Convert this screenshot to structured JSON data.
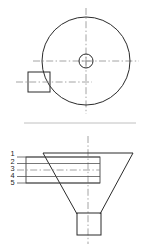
{
  "drawing": {
    "title": "Conical hopper two-view engineering drawing",
    "views": [
      {
        "id": "top-view",
        "name": "Top view",
        "shapes": {
          "circle": {
            "cx": 86,
            "cy": 61,
            "r": 44
          },
          "hub_outer": {
            "cx": 86,
            "cy": 61,
            "r": 7
          },
          "hub_inner_marker": "plus",
          "inlet_box": {
            "x": 28,
            "y": 72,
            "width": 22,
            "height": 20
          }
        },
        "centerlines": {
          "vertical": {
            "x": 86,
            "y1": 8,
            "y2": 114
          },
          "horizontal": {
            "y": 61,
            "x1": 33,
            "x2": 139
          },
          "inlet_horizontal": {
            "y": 82,
            "x1": 16,
            "x2": 92
          }
        }
      },
      {
        "id": "front-section-view",
        "name": "Front section view",
        "shapes": {
          "funnel_top": {
            "x1": 43,
            "x2": 133,
            "y": 153
          },
          "funnel_left_slope": {
            "x1": 43,
            "y1": 153,
            "x2": 77,
            "y2": 214
          },
          "funnel_right_slope": {
            "x1": 133,
            "y1": 153,
            "x2": 100,
            "y2": 214
          },
          "spout_box": {
            "x": 77,
            "y": 213,
            "width": 24,
            "height": 22
          },
          "layer_box": {
            "x": 26,
            "y": 157,
            "width": 74,
            "height": 26
          }
        },
        "centerlines": {
          "vertical": {
            "x": 88,
            "y1": 136,
            "y2": 244
          },
          "layer_horizontal": {
            "y": 170,
            "x1": 22,
            "x2": 100
          }
        },
        "hatch_lines_y": [
          157,
          163,
          170,
          176,
          183
        ],
        "hatch_extent": {
          "x1": 26,
          "x2": 100
        },
        "leader_extent": {
          "x1": 17,
          "x2": 26
        }
      }
    ],
    "separator": {
      "y": 123,
      "x1": 24,
      "x2": 136
    },
    "callouts": [
      {
        "label": "1",
        "x": 13,
        "y": 156
      },
      {
        "label": "2",
        "x": 13,
        "y": 163
      },
      {
        "label": "3",
        "x": 13,
        "y": 170
      },
      {
        "label": "4",
        "x": 13,
        "y": 177
      },
      {
        "label": "5",
        "x": 13,
        "y": 184
      }
    ],
    "colors": {
      "outline": "#2b2b2b",
      "centerline": "#8e8e8e",
      "hatch": "#4a4a4a",
      "separator": "#b9b9b9",
      "background": "#ffffff",
      "label_text": "#242424"
    }
  }
}
